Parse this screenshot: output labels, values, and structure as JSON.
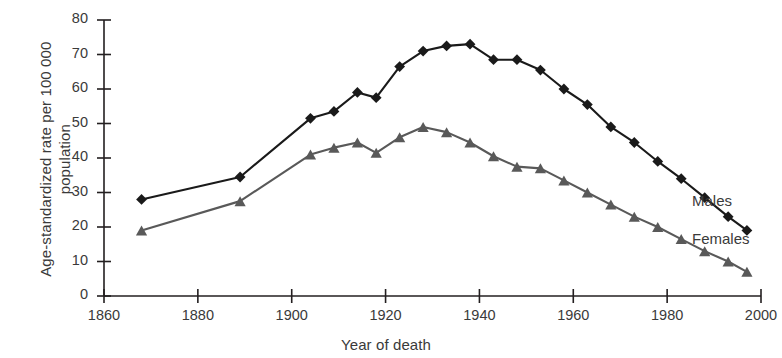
{
  "chart_data": {
    "type": "line",
    "title": "",
    "xlabel": "Year of death",
    "ylabel": "Age-standardized rate per 100 000 population",
    "ylabel_lines": [
      "Age-standardized rate per 100 000",
      "population"
    ],
    "xlim": [
      1860,
      2000
    ],
    "ylim": [
      0,
      80
    ],
    "xticks": [
      1860,
      1880,
      1900,
      1920,
      1940,
      1960,
      1980,
      2000
    ],
    "yticks": [
      0,
      10,
      20,
      30,
      40,
      50,
      60,
      70,
      80
    ],
    "grid": false,
    "legend_position": "right-inline",
    "series": [
      {
        "name": "Males",
        "color": "#1a1a1a",
        "marker": "diamond",
        "x": [
          1868,
          1889,
          1904,
          1909,
          1914,
          1918,
          1923,
          1928,
          1933,
          1938,
          1943,
          1948,
          1953,
          1958,
          1963,
          1968,
          1973,
          1978,
          1983,
          1988,
          1993,
          1997
        ],
        "values": [
          28,
          34.5,
          51.5,
          53.5,
          59,
          57.5,
          66.5,
          71,
          72.5,
          73,
          68.5,
          68.5,
          65.5,
          60,
          55.5,
          49,
          44.5,
          39,
          34,
          28.5,
          23,
          19
        ]
      },
      {
        "name": "Females",
        "color": "#595959",
        "marker": "triangle",
        "x": [
          1868,
          1889,
          1904,
          1909,
          1914,
          1918,
          1923,
          1928,
          1933,
          1938,
          1943,
          1948,
          1953,
          1958,
          1963,
          1968,
          1973,
          1978,
          1983,
          1988,
          1993,
          1997
        ],
        "values": [
          19,
          27.5,
          41,
          43,
          44.5,
          41.5,
          46,
          49,
          47.5,
          44.5,
          40.5,
          37.5,
          37,
          33.5,
          30,
          26.5,
          23,
          20,
          16.5,
          13,
          10,
          7
        ]
      }
    ]
  },
  "legend": {
    "males_label": "Males",
    "females_label": "Females"
  }
}
